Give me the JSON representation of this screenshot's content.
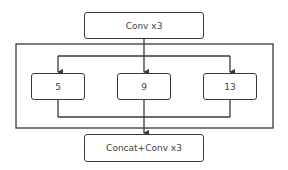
{
  "diagram": {
    "top_block": {
      "label": "Conv x3"
    },
    "branches": [
      {
        "label": "5"
      },
      {
        "label": "9"
      },
      {
        "label": "13"
      }
    ],
    "bottom_block": {
      "label": "Concat+Conv x3"
    },
    "colors": {
      "stroke": "#3a3a3a",
      "text": "#444444",
      "background": "#ffffff"
    }
  }
}
